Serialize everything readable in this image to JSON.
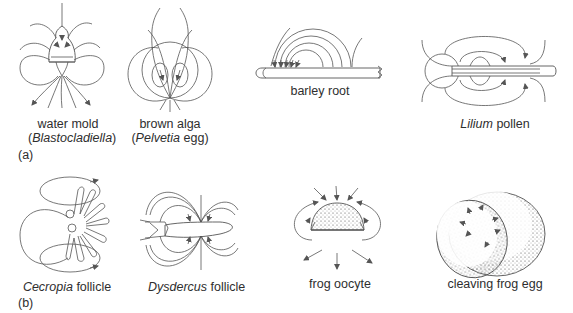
{
  "figure": {
    "panels": [
      {
        "id": "a",
        "label": "(a)",
        "items": [
          {
            "name": "water-mold",
            "label_line1": "water mold",
            "label_open": "(",
            "label_italic": "Blastocladiella",
            "label_close": ")"
          },
          {
            "name": "brown-alga",
            "label_line1": "brown alga",
            "label_open": "(",
            "label_italic": "Pelvetia",
            "label_rest": " egg)"
          },
          {
            "name": "barley-root",
            "label_line1": "barley root"
          },
          {
            "name": "lilium-pollen",
            "label_italic": "Lilium",
            "label_rest": " pollen"
          }
        ]
      },
      {
        "id": "b",
        "label": "(b)",
        "items": [
          {
            "name": "cecropia-follicle",
            "label_italic": "Cecropia",
            "label_rest": " follicle"
          },
          {
            "name": "dysdercus-follicle",
            "label_italic": "Dysdercus",
            "label_rest": " follicle"
          },
          {
            "name": "frog-oocyte",
            "label_line1": "frog oocyte"
          },
          {
            "name": "cleaving-frog-egg",
            "label_line1": "cleaving frog egg"
          }
        ]
      }
    ]
  }
}
